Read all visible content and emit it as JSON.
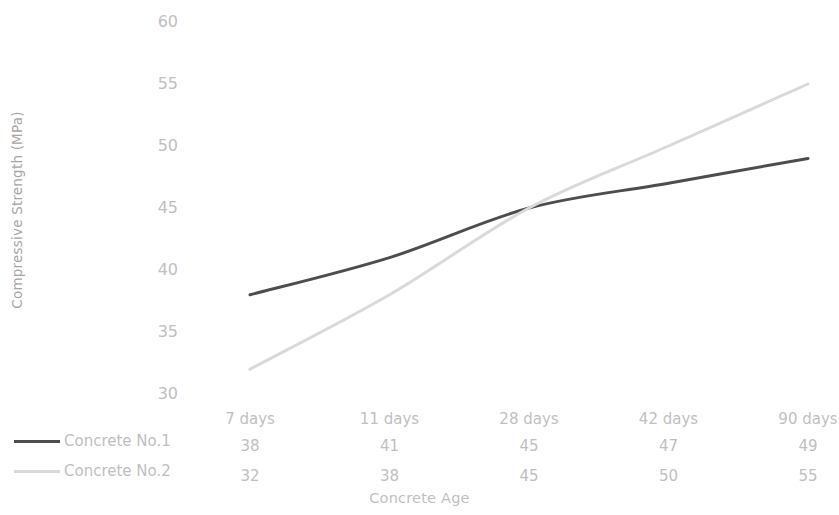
{
  "chart_data": {
    "type": "line",
    "title": "",
    "xlabel": "Concrete Age",
    "ylabel": "Compressive Strength (MPa)",
    "categories": [
      "7 days",
      "11 days",
      "28 days",
      "42 days",
      "90 days"
    ],
    "series": [
      {
        "name": "Concrete No.1",
        "values": [
          38,
          41,
          45,
          47,
          49
        ],
        "color": "#4d4d4d",
        "line_width": 3,
        "line_style": "solid"
      },
      {
        "name": "Concrete No.2",
        "values": [
          32,
          38,
          45,
          50,
          55
        ],
        "color": "#d9d9d9",
        "line_width": 3,
        "line_style": "solid"
      }
    ],
    "ylim": [
      30,
      60
    ],
    "yticks": [
      30,
      35,
      40,
      45,
      50,
      55,
      60
    ],
    "ytick_labels": [
      "30",
      "35",
      "40",
      "45",
      "50",
      "55",
      "60"
    ],
    "grid": false,
    "legend_position": "below-left",
    "data_table_visible": true,
    "axis_line_visible": false,
    "markers": false,
    "background_color": "#ffffff",
    "tick_label_color": "#bfbfbf",
    "axis_title_color": "#bfbfbf"
  }
}
